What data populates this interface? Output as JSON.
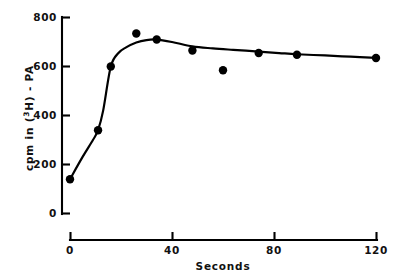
{
  "figure": {
    "background_color": "#ffffff",
    "ink_color": "#000000"
  },
  "chart_data": {
    "type": "scatter",
    "title": "",
    "subtitle": "",
    "xlabel": "Seconds",
    "ylabel": "cpm in (3H) - PA",
    "ylabel_parts": {
      "prefix": "cpm in (",
      "superscript": "3",
      "middle": "H) - PA"
    },
    "xlim": [
      0,
      126
    ],
    "ylim": [
      0,
      800
    ],
    "xticks": [
      0,
      40,
      80,
      120
    ],
    "xtick_labels": [
      "0",
      "40",
      "80",
      "120"
    ],
    "yticks": [
      0,
      200,
      400,
      600,
      800
    ],
    "ytick_labels": [
      "0",
      "200",
      "400",
      "600",
      "800"
    ],
    "grid": false,
    "legend": false,
    "legend_position": "none",
    "marker_style": "filled-circle",
    "marker_color": "#000000",
    "line_color": "#000000",
    "x": [
      0,
      11,
      16,
      26,
      34,
      48,
      60,
      74,
      89,
      120
    ],
    "y": [
      140,
      340,
      600,
      735,
      710,
      665,
      585,
      655,
      648,
      635
    ],
    "series": [
      {
        "name": "cpm in (3H) - PA",
        "x": [
          0,
          11,
          16,
          26,
          34,
          48,
          60,
          74,
          89,
          120
        ],
        "values": [
          140,
          340,
          600,
          735,
          710,
          665,
          585,
          655,
          648,
          635
        ]
      }
    ],
    "fitted_curve": {
      "description": "smoothed trend line through points",
      "x": [
        0,
        5,
        9,
        11,
        13,
        16,
        19,
        22,
        26,
        30,
        34,
        40,
        48,
        56,
        64,
        74,
        82,
        89,
        100,
        110,
        120
      ],
      "y": [
        140,
        232,
        300,
        340,
        420,
        600,
        655,
        678,
        698,
        708,
        710,
        700,
        682,
        674,
        668,
        661,
        655,
        650,
        645,
        640,
        635
      ]
    },
    "annotations": []
  },
  "ticks": {
    "x": [
      "0",
      "40",
      "80",
      "120"
    ],
    "y": [
      "0",
      "200",
      "400",
      "600",
      "800"
    ]
  }
}
